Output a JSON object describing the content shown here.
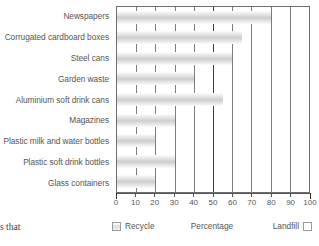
{
  "caption": {
    "fragment": "s that"
  },
  "legend": {
    "recycle_label": "Recycle",
    "axis_title": "Percentage",
    "landfill_label": "Landfill",
    "recycle_swatch": "recycle-swatch-icon",
    "landfill_swatch": "landfill-swatch-icon"
  },
  "colors": {
    "bar_fill": "#d8d8d8",
    "plot_border": "#6e6e6e",
    "gridline": "#7d7d7d",
    "gridline_major": "#3f3f3f",
    "text": "#555555",
    "background": "#ffffff"
  },
  "chart_data": {
    "type": "bar",
    "orientation": "horizontal",
    "title": "",
    "xlabel": "Percentage",
    "ylabel": "",
    "xlim": [
      0,
      100
    ],
    "xticks": [
      0,
      10,
      20,
      30,
      40,
      50,
      60,
      70,
      80,
      90,
      100
    ],
    "xtick_labels": [
      "0",
      "10",
      "20",
      "30",
      "40",
      "50",
      "60",
      "70",
      "80",
      "90",
      "100"
    ],
    "grid": true,
    "major_gridline_at": 50,
    "legend_position": "bottom",
    "legend_entries": [
      "Recycle",
      "Landfill"
    ],
    "categories": [
      "Newspapers",
      "Corrugated cardboard boxes",
      "Steel cans",
      "Garden waste",
      "Aluminium soft drink cans",
      "Magazines",
      "Plastic milk and water bottles",
      "Plastic soft drink bottles",
      "Glass containers"
    ],
    "values": [
      80,
      65,
      60,
      40,
      55,
      30,
      20,
      30,
      20
    ],
    "series": [
      {
        "name": "Recycle",
        "values": [
          80,
          65,
          60,
          40,
          55,
          30,
          20,
          30,
          20
        ]
      },
      {
        "name": "Landfill",
        "values": [
          20,
          35,
          40,
          60,
          45,
          70,
          80,
          70,
          80
        ]
      }
    ]
  }
}
